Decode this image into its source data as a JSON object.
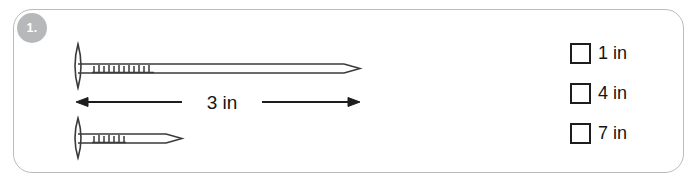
{
  "question": {
    "number_badge": "1.",
    "badge_color": "#b6b8ba"
  },
  "figure": {
    "name": "two-nails-comparison",
    "dimension_label": "3 in",
    "long_nail": {
      "name": "long-nail",
      "knurl_tick_count": 12
    },
    "short_nail": {
      "name": "short-nail",
      "knurl_tick_count": 7
    },
    "stroke_color": "#3a3a3a"
  },
  "options": [
    {
      "label": "1 in",
      "checked": false
    },
    {
      "label": "4 in",
      "checked": false
    },
    {
      "label": "7 in",
      "checked": false
    }
  ]
}
